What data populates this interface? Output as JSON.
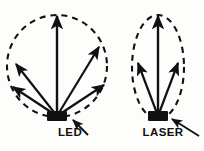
{
  "figure": {
    "background_color": "#fdfdfb",
    "ink_color": "#111111",
    "panels": [
      {
        "id": "led",
        "label": "LED",
        "label_x": 70,
        "label_y": 134,
        "pattern_shape": "circle",
        "pattern_description": "wide broad-angle circular emission lobe drawn as a dashed circle",
        "emitter_x": 57,
        "emitter_y": 116,
        "emitter_width": 20,
        "emitter_height": 10,
        "lobe_cx": 57,
        "lobe_cy": 66,
        "lobe_rx": 50,
        "lobe_ry": 51,
        "lobe_dash": "6 5",
        "beam_count": 5,
        "beams": [
          {
            "name": "beam-far-left",
            "angle_deg": 205,
            "tip_x": 14,
            "tip_y": 62
          },
          {
            "name": "beam-left",
            "angle_deg": 230,
            "tip_x": 10,
            "tip_y": 86
          },
          {
            "name": "beam-center",
            "angle_deg": 270,
            "tip_x": 57,
            "tip_y": 13
          },
          {
            "name": "beam-right",
            "angle_deg": 315,
            "tip_x": 101,
            "tip_y": 45
          },
          {
            "name": "beam-far-right",
            "angle_deg": 340,
            "tip_x": 107,
            "tip_y": 84
          }
        ],
        "pointer": {
          "from_x": 88,
          "from_y": 136,
          "to_x": 74,
          "to_y": 121
        }
      },
      {
        "id": "laser",
        "label": "LASER",
        "label_x": 163,
        "label_y": 134,
        "pattern_shape": "ellipse",
        "pattern_description": "narrow collimated emission lobe drawn as a tall dashed ellipse",
        "emitter_x": 158,
        "emitter_y": 116,
        "emitter_width": 20,
        "emitter_height": 10,
        "lobe_cx": 158,
        "lobe_cy": 67,
        "lobe_rx": 26,
        "lobe_ry": 52,
        "lobe_dash": "6 5",
        "beam_count": 3,
        "beams": [
          {
            "name": "beam-left",
            "angle_deg": 250,
            "tip_x": 136,
            "tip_y": 61
          },
          {
            "name": "beam-center",
            "angle_deg": 270,
            "tip_x": 158,
            "tip_y": 13
          },
          {
            "name": "beam-right",
            "angle_deg": 290,
            "tip_x": 180,
            "tip_y": 61
          }
        ],
        "pointer": {
          "from_x": 198,
          "from_y": 136,
          "to_x": 174,
          "to_y": 120
        }
      }
    ]
  }
}
